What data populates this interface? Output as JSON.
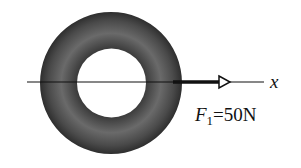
{
  "diagram": {
    "axis": {
      "label": "x"
    },
    "force": {
      "symbol": "F",
      "subscript": "1",
      "value": "=50N"
    },
    "object": {
      "shape": "torus",
      "ring_color": "#4a4a4a"
    }
  }
}
